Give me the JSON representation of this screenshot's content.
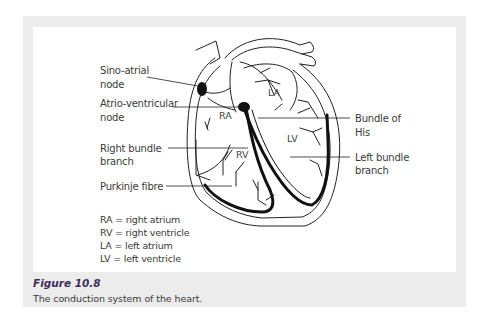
{
  "figure": {
    "number": "Figure 10.8",
    "caption": "The conduction system of the heart."
  },
  "labels": {
    "sino_atrial_1": "Sino-atrial",
    "sino_atrial_2": "node",
    "atrio_ventricular_1": "Atrio-ventricular",
    "atrio_ventricular_2": "node",
    "right_bundle_1": "Right bundle",
    "right_bundle_2": "branch",
    "purkinje": "Purkinje fibre",
    "bundle_his_1": "Bundle of",
    "bundle_his_2": "His",
    "left_bundle_1": "Left bundle",
    "left_bundle_2": "branch"
  },
  "chambers": {
    "ra": "RA",
    "rv": "RV",
    "la": "LA",
    "lv": "LV"
  },
  "legend": [
    "RA = right atrium",
    "RV = right ventricle",
    "LA = left atrium",
    "LV = left ventricle"
  ],
  "colors": {
    "frame": "#ececec",
    "panel": "#ffffff",
    "figure_number": "#3f2a5a",
    "text": "#3a3a3a"
  }
}
